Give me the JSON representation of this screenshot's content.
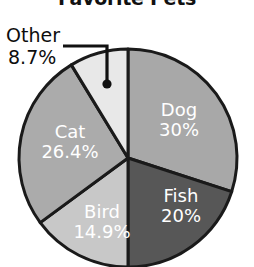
{
  "chart_data": {
    "type": "pie",
    "title": "Favorite Pets",
    "xlabel": "",
    "ylabel": "",
    "legend": "none",
    "grid": false,
    "categories": [
      "Dog",
      "Fish",
      "Bird",
      "Cat",
      "Other"
    ],
    "values": [
      30,
      20,
      14.9,
      26.4,
      8.7
    ],
    "value_labels": [
      "30%",
      "20%",
      "14.9%",
      "26.4%",
      "8.7%"
    ],
    "slices": [
      {
        "name": "Dog",
        "value": 30,
        "label": "30%",
        "color": "#a8a8a8",
        "label_color": "#ffffff",
        "callout": false
      },
      {
        "name": "Fish",
        "value": 20,
        "label": "20%",
        "color": "#575757",
        "label_color": "#ffffff",
        "callout": false
      },
      {
        "name": "Bird",
        "value": 14.9,
        "label": "14.9%",
        "color": "#c8c8c8",
        "label_color": "#ffffff",
        "callout": false
      },
      {
        "name": "Cat",
        "value": 26.4,
        "label": "26.4%",
        "color": "#ababab",
        "label_color": "#ffffff",
        "callout": false
      },
      {
        "name": "Other",
        "value": 8.7,
        "label": "8.7%",
        "color": "#e8e8e8",
        "label_color": "#0d0d0d",
        "callout": true
      }
    ],
    "start_angle_deg": 0,
    "direction": "clockwise",
    "total": 100,
    "outline_color": "#1a1a1a"
  },
  "callouts": {
    "other": {
      "name": "Other",
      "pct": "8.7%"
    }
  },
  "labels": {
    "dog": {
      "name": "Dog",
      "pct": "30%"
    },
    "cat": {
      "name": "Cat",
      "pct": "26.4%"
    },
    "fish": {
      "name": "Fish",
      "pct": "20%"
    },
    "bird": {
      "name": "Bird",
      "pct": "14.9%"
    }
  }
}
